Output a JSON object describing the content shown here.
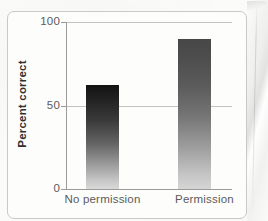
{
  "figure": {
    "background_color": "#fbfbfa",
    "frame_color": "#c9c9c7",
    "axis_color": "#9b9b99",
    "gridline_color": "#c2c2c0",
    "label_color": "#5b5b59",
    "title_color": "#2f2f2e"
  },
  "chart_data": {
    "type": "bar",
    "title": "",
    "xlabel": "",
    "ylabel": "Percent correct",
    "categories": [
      "No permission",
      "Permission"
    ],
    "values": [
      62,
      90
    ],
    "ylim": [
      0,
      100
    ],
    "yticks": [
      0,
      50,
      100
    ],
    "ytick_labels": [
      "0",
      "50",
      "100"
    ],
    "grid": "horizontal gridlines at 50 and 100",
    "legend": "none",
    "series": [
      {
        "name": "Percent correct",
        "values": [
          62,
          90
        ]
      }
    ],
    "bar_styles": [
      {
        "category": "No permission",
        "gradient_top": "#131313",
        "gradient_bottom": "#d9d9d9"
      },
      {
        "category": "Permission",
        "gradient_top": "#474747",
        "gradient_bottom": "#d6d6d6"
      }
    ]
  },
  "axis": {
    "y_title": "Percent correct",
    "y_tick_100": "100",
    "y_tick_50": "50",
    "y_tick_0": "0"
  },
  "bars": [
    {
      "label": "No permission",
      "value": 62
    },
    {
      "label": "Permission",
      "value": 90
    }
  ]
}
